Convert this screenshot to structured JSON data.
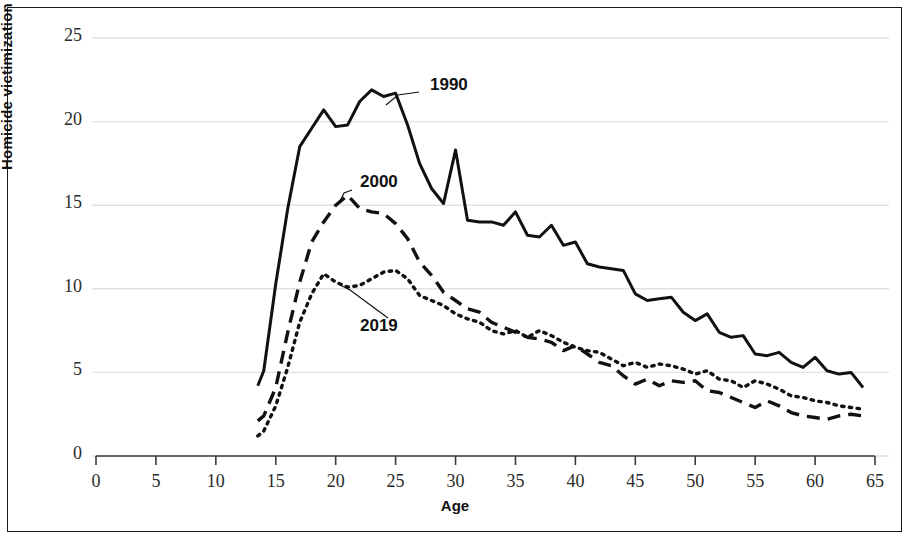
{
  "chart_data": {
    "type": "line",
    "title": "",
    "subtitle": "",
    "xlabel": "Age",
    "ylabel": "Homicide victimization rate per 100,000",
    "xlim": [
      0,
      65
    ],
    "ylim": [
      0,
      25
    ],
    "xticks": [
      0,
      5,
      10,
      15,
      20,
      25,
      30,
      35,
      40,
      45,
      50,
      55,
      60,
      65
    ],
    "yticks": [
      0,
      5,
      10,
      15,
      20,
      25
    ],
    "grid": "horizontal-faint",
    "legend_position": "inline-annotations",
    "annotations": [
      {
        "text": "1990",
        "points_to_series": "1990",
        "x": 24.0,
        "y": 21.6
      },
      {
        "text": "2000",
        "points_to_series": "2000",
        "x": 20.8,
        "y": 15.6
      },
      {
        "text": "2019",
        "points_to_series": "2019",
        "x": 21.0,
        "y": 9.7
      }
    ],
    "series": [
      {
        "name": "1990",
        "line_style": "solid",
        "color": "#111111",
        "x": [
          13.5,
          14,
          15,
          16,
          17,
          18,
          19,
          20,
          21,
          22,
          23,
          24,
          25,
          26,
          27,
          28,
          29,
          30,
          31,
          32,
          33,
          34,
          35,
          36,
          37,
          38,
          39,
          40,
          41,
          42,
          43,
          44,
          45,
          46,
          47,
          48,
          49,
          50,
          51,
          52,
          53,
          54,
          55,
          56,
          57,
          58,
          59,
          60,
          61,
          62,
          63,
          64
        ],
        "values": [
          4.2,
          5.1,
          10.3,
          14.8,
          18.5,
          19.6,
          20.7,
          19.7,
          19.8,
          21.2,
          21.9,
          21.5,
          21.7,
          19.8,
          17.5,
          16.0,
          15.1,
          18.3,
          14.1,
          14.0,
          14.0,
          13.8,
          14.6,
          13.2,
          13.1,
          13.8,
          12.6,
          12.8,
          11.5,
          11.3,
          11.2,
          11.1,
          9.7,
          9.3,
          9.4,
          9.5,
          8.6,
          8.1,
          8.5,
          7.4,
          7.1,
          7.2,
          6.1,
          6.0,
          6.2,
          5.6,
          5.3,
          5.9,
          5.1,
          4.9,
          5.0,
          4.1
        ]
      },
      {
        "name": "2000",
        "line_style": "dashed",
        "color": "#111111",
        "x": [
          13.5,
          14,
          15,
          16,
          17,
          18,
          19,
          20,
          21,
          22,
          23,
          24,
          25,
          26,
          27,
          28,
          29,
          30,
          31,
          32,
          33,
          34,
          35,
          36,
          37,
          38,
          39,
          40,
          41,
          42,
          43,
          44,
          45,
          46,
          47,
          48,
          49,
          50,
          51,
          52,
          53,
          54,
          55,
          56,
          57,
          58,
          59,
          60,
          61,
          62,
          63,
          64
        ],
        "values": [
          2.1,
          2.4,
          4.1,
          7.4,
          10.4,
          12.8,
          14.0,
          15.0,
          15.6,
          14.8,
          14.6,
          14.5,
          13.9,
          13.0,
          11.6,
          10.8,
          9.8,
          9.3,
          8.8,
          8.6,
          8.0,
          7.7,
          7.4,
          7.1,
          7.0,
          6.8,
          6.3,
          6.6,
          6.1,
          5.6,
          5.4,
          4.8,
          4.3,
          4.6,
          4.2,
          4.5,
          4.4,
          4.5,
          3.9,
          3.8,
          3.5,
          3.2,
          2.9,
          3.3,
          3.0,
          2.6,
          2.4,
          2.3,
          2.2,
          2.4,
          2.5,
          2.4
        ]
      },
      {
        "name": "2019",
        "line_style": "dotted",
        "color": "#111111",
        "x": [
          13.5,
          14,
          15,
          16,
          17,
          18,
          19,
          20,
          21,
          22,
          23,
          24,
          25,
          26,
          27,
          28,
          29,
          30,
          31,
          32,
          33,
          34,
          35,
          36,
          37,
          38,
          39,
          40,
          41,
          42,
          43,
          44,
          45,
          46,
          47,
          48,
          49,
          50,
          51,
          52,
          53,
          54,
          55,
          56,
          57,
          58,
          59,
          60,
          61,
          62,
          63,
          64
        ],
        "values": [
          1.2,
          1.5,
          3.0,
          5.3,
          8.0,
          9.7,
          10.9,
          10.4,
          10.1,
          10.2,
          10.6,
          11.0,
          11.1,
          10.6,
          9.6,
          9.3,
          9.0,
          8.5,
          8.2,
          8.0,
          7.5,
          7.3,
          7.5,
          7.1,
          7.5,
          7.2,
          6.8,
          6.5,
          6.3,
          6.2,
          5.8,
          5.4,
          5.6,
          5.3,
          5.5,
          5.4,
          5.2,
          4.9,
          5.1,
          4.6,
          4.5,
          4.1,
          4.5,
          4.3,
          4.0,
          3.6,
          3.5,
          3.3,
          3.2,
          3.0,
          2.9,
          2.8
        ]
      }
    ]
  },
  "axes": {
    "y_title": "Homicide victimization rate per 100,000",
    "x_title": "Age",
    "y_tick_labels": [
      "0",
      "5",
      "10",
      "15",
      "20",
      "25"
    ],
    "x_tick_labels": [
      "0",
      "5",
      "10",
      "15",
      "20",
      "25",
      "30",
      "35",
      "40",
      "45",
      "50",
      "55",
      "60",
      "65"
    ]
  },
  "series_labels": {
    "s1990": "1990",
    "s2000": "2000",
    "s2019": "2019"
  },
  "colors": {
    "ink": "#111111",
    "grid": "#e2e2e2",
    "axis": "#3a3a3a",
    "background": "#ffffff"
  }
}
